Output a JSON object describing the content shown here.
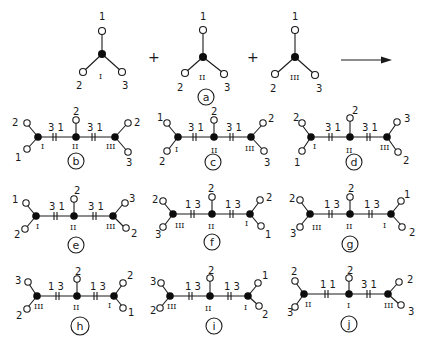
{
  "diagram": {
    "type": "trimer-assembly-combinatorics",
    "reaction": {
      "monomers": [
        {
          "id": "I",
          "roman": "I",
          "port_labels": {
            "top": "1",
            "left": "2",
            "right": "3"
          }
        },
        {
          "id": "II",
          "roman": "II",
          "port_labels": {
            "top": "1",
            "left": "2",
            "right": "3"
          }
        },
        {
          "id": "III",
          "roman": "III",
          "port_labels": {
            "top": "1",
            "left": "2",
            "right": "3"
          }
        }
      ],
      "operators": [
        "+",
        "+"
      ],
      "arrow": "→",
      "label": "a"
    },
    "products": [
      {
        "label": "b",
        "order": [
          "I",
          "II",
          "III"
        ],
        "bond1": "3 1",
        "bond2": "3 1",
        "left_ports": [
          "2",
          "1"
        ],
        "center_port": "2",
        "right_ports": [
          "2",
          "3"
        ]
      },
      {
        "label": "c",
        "order": [
          "I",
          "II",
          "III"
        ],
        "bond1": "3 1",
        "bond2": "3 1",
        "left_ports": [
          "1",
          "2"
        ],
        "center_port": "2",
        "right_ports": [
          "2",
          "3"
        ]
      },
      {
        "label": "d",
        "order": [
          "I",
          "II",
          "III"
        ],
        "bond1": "3 1",
        "bond2": "3 1",
        "left_ports": [
          "2",
          "1"
        ],
        "center_port": "2",
        "right_ports": [
          "3",
          "2"
        ]
      },
      {
        "label": "e",
        "order": [
          "I",
          "II",
          "III"
        ],
        "bond1": "3 1",
        "bond2": "3 1",
        "left_ports": [
          "1",
          "2"
        ],
        "center_port": "2",
        "right_ports": [
          "3",
          "2"
        ]
      },
      {
        "label": "f",
        "order": [
          "III",
          "II",
          "I"
        ],
        "bond1": "1 3",
        "bond2": "1 3",
        "left_ports": [
          "2",
          "3"
        ],
        "center_port": "2",
        "right_ports": [
          "2",
          "1"
        ]
      },
      {
        "label": "g",
        "order": [
          "III",
          "II",
          "I"
        ],
        "bond1": "1 3",
        "bond2": "1 3",
        "left_ports": [
          "2",
          "3"
        ],
        "center_port": "2",
        "right_ports": [
          "1",
          "2"
        ]
      },
      {
        "label": "h",
        "order": [
          "III",
          "II",
          "I"
        ],
        "bond1": "1 3",
        "bond2": "1 3",
        "left_ports": [
          "3",
          "2"
        ],
        "center_port": "2",
        "right_ports": [
          "2",
          "1"
        ]
      },
      {
        "label": "i",
        "order": [
          "III",
          "II",
          "I"
        ],
        "bond1": "1 3",
        "bond2": "1 3",
        "left_ports": [
          "3",
          "2"
        ],
        "center_port": "2",
        "right_ports": [
          "1",
          "2"
        ]
      },
      {
        "label": "j",
        "order": [
          "II",
          "I",
          "III"
        ],
        "bond1": "1 1",
        "bond2": "3 1",
        "left_ports": [
          "2",
          "3"
        ],
        "center_port": "2",
        "right_ports": [
          "2",
          "3"
        ]
      }
    ]
  }
}
